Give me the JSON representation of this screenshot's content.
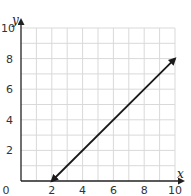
{
  "chart_data": {
    "type": "line",
    "title": "",
    "xlabel": "x",
    "ylabel": "y",
    "xlim": [
      0,
      10
    ],
    "ylim": [
      0,
      10
    ],
    "x_ticks": [
      "0",
      "2",
      "4",
      "6",
      "8",
      "10"
    ],
    "y_ticks": [
      "2",
      "4",
      "6",
      "8",
      "10"
    ],
    "grid": true,
    "grid_step": 1,
    "legend": null,
    "series": [
      {
        "name": "line",
        "equation": "y = x - 2",
        "x": [
          2,
          10
        ],
        "y": [
          0,
          8
        ],
        "arrows_both_ends": true
      }
    ]
  },
  "colors": {
    "grid": "#d9d9d9",
    "axis": "#222222",
    "line": "#1a1a1a"
  }
}
